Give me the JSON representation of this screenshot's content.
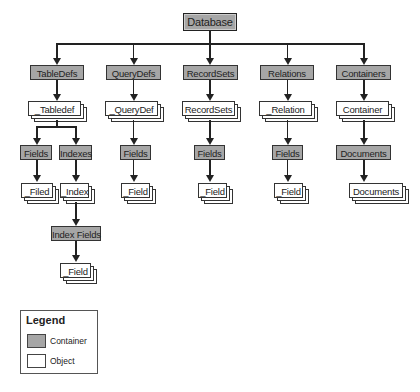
{
  "diagram": {
    "root": "Database",
    "containers": [
      "TableDefs",
      "QueryDefs",
      "RecordSets",
      "Relations",
      "Containers"
    ],
    "objects": [
      "_Tabledef",
      "_QueryDef",
      "RecordSets",
      "_Relation",
      "Container"
    ],
    "level3": {
      "tabledef_fields": "Fields",
      "tabledef_indexes": "Indexes",
      "querydef_fields": "Fields",
      "recordset_fields": "Fields",
      "relation_fields": "Fields",
      "container_documents": "Documents"
    },
    "level4": {
      "tabledef_field": "_Filed",
      "tabledef_index": "_Index",
      "querydef_field": "_Field",
      "recordset_field": "_Field",
      "relation_field": "_Field",
      "container_document": "Documents"
    },
    "index_fields": "Index Fields",
    "index_field": "_Field"
  },
  "legend": {
    "title": "Legend",
    "container_label": "Container",
    "object_label": "Object",
    "container_color": "#a6a6a6",
    "object_color": "#ffffff"
  }
}
